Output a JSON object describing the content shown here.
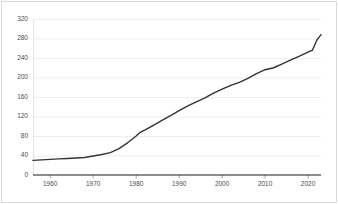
{
  "chart_data": {
    "type": "line",
    "title": "",
    "subtitle": "",
    "xlabel": "",
    "ylabel": "",
    "xlim": [
      1956,
      2023
    ],
    "ylim": [
      0,
      320
    ],
    "grid": true,
    "legend": false,
    "legend_position": "none",
    "line_color": "#333333",
    "grid_color": "#e6e6e6",
    "axis_color": "#1a1a1a",
    "tick_label_color": "#4d4d4d",
    "background_color": "#ffffff",
    "yticks": [
      0,
      40,
      80,
      120,
      160,
      200,
      240,
      280,
      320
    ],
    "ytick_labels": [
      "0",
      "40",
      "80",
      "120",
      "160",
      "200",
      "240",
      "280",
      "320"
    ],
    "xticks": [
      1960,
      1970,
      1980,
      1990,
      2000,
      2010,
      2020
    ],
    "xtick_labels": [
      "1960",
      "1970",
      "1980",
      "1990",
      "2000",
      "2010",
      "2020"
    ],
    "series": [
      {
        "name": "series-1",
        "color": "#333333",
        "x": [
          1956,
          1958,
          1960,
          1962,
          1964,
          1966,
          1968,
          1970,
          1972,
          1974,
          1976,
          1978,
          1980,
          1981,
          1982,
          1984,
          1986,
          1988,
          1990,
          1992,
          1994,
          1996,
          1998,
          2000,
          2002,
          2004,
          2006,
          2008,
          2010,
          2012,
          2014,
          2016,
          2018,
          2020,
          2021,
          2022,
          2023
        ],
        "values": [
          30,
          31,
          32,
          33,
          34,
          35,
          36,
          39,
          42,
          46,
          54,
          66,
          80,
          88,
          92,
          102,
          112,
          122,
          132,
          142,
          150,
          158,
          168,
          176,
          184,
          190,
          198,
          208,
          216,
          220,
          228,
          236,
          244,
          252,
          256,
          276,
          288
        ]
      }
    ]
  }
}
